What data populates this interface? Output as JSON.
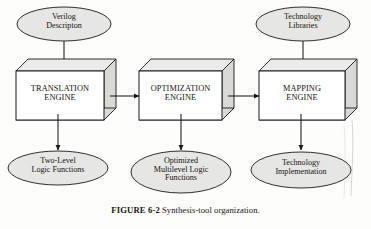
{
  "figure": {
    "caption_label": "FIGURE 6-2",
    "caption_text": "Synthesis-tool organization.",
    "background_color": "#fdfdfb",
    "shape_fill": "#e6e6e4",
    "box_front_fill": "#ffffff",
    "box_side_fill": "#d9d9d6",
    "stroke_color": "#1c1a18",
    "text_color": "#16120f",
    "type": "flow-diagram"
  },
  "inputs": [
    {
      "id": "verilog-description",
      "label": "Verilog\nDescripton",
      "shape": "ellipse"
    },
    {
      "id": "technology-libraries",
      "label": "Technology\nLibraries",
      "shape": "ellipse"
    }
  ],
  "stages": [
    {
      "id": "translation-engine",
      "label": "TRANSLATION\nENGINE",
      "shape": "cube"
    },
    {
      "id": "optimization-engine",
      "label": "OPTIMIZATION\nENGINE",
      "shape": "cube"
    },
    {
      "id": "mapping-engine",
      "label": "MAPPING\nENGINE",
      "shape": "cube"
    }
  ],
  "outputs": [
    {
      "id": "two-level-logic-functions",
      "label": "Two-Level\nLogic Functions",
      "shape": "ellipse"
    },
    {
      "id": "optimized-multilevel-logic-functions",
      "label": "Optimized\nMultilevel Logic\nFunctions",
      "shape": "ellipse"
    },
    {
      "id": "technology-implementation",
      "label": "Technology\nImplementation",
      "shape": "ellipse"
    }
  ],
  "connections": [
    {
      "id": "verilog-to-translation",
      "from": "verilog-description",
      "to": "translation-engine",
      "direction": "down"
    },
    {
      "id": "libraries-to-mapping",
      "from": "technology-libraries",
      "to": "mapping-engine",
      "direction": "down"
    },
    {
      "id": "translation-to-optimization",
      "from": "translation-engine",
      "to": "optimization-engine",
      "direction": "right"
    },
    {
      "id": "optimization-to-mapping",
      "from": "optimization-engine",
      "to": "mapping-engine",
      "direction": "right"
    },
    {
      "id": "translation-to-twolevel",
      "from": "translation-engine",
      "to": "two-level-logic-functions",
      "direction": "down"
    },
    {
      "id": "optimization-to-multilevel",
      "from": "optimization-engine",
      "to": "optimized-multilevel-logic-functions",
      "direction": "down"
    },
    {
      "id": "mapping-to-implementation",
      "from": "mapping-engine",
      "to": "technology-implementation",
      "direction": "down"
    }
  ]
}
